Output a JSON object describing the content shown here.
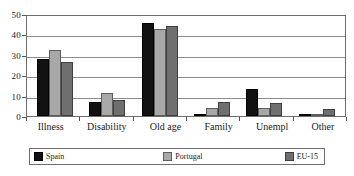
{
  "chart_data": {
    "type": "bar",
    "title": "",
    "subtitle": "",
    "xlabel": "",
    "ylabel": "",
    "ylim": [
      0,
      50
    ],
    "yticks": [
      0,
      10,
      20,
      30,
      40,
      50
    ],
    "grid": true,
    "legend_position": "bottom",
    "categories": [
      "Illness",
      "Disability",
      "Old age",
      "Family",
      "Unempl",
      "Other"
    ],
    "series": [
      {
        "name": "Spain",
        "color": "#121212",
        "values": [
          28.0,
          7.0,
          45.5,
          0.5,
          13.0,
          0.5
        ]
      },
      {
        "name": "Portugal",
        "color": "#a8a8a8",
        "values": [
          32.5,
          11.5,
          42.5,
          4.0,
          4.0,
          0.5
        ]
      },
      {
        "name": "EU-15",
        "color": "#6f6f6f",
        "values": [
          26.5,
          8.0,
          44.0,
          7.0,
          6.5,
          3.5
        ]
      }
    ]
  },
  "legend": {
    "items": [
      {
        "label": "Spain"
      },
      {
        "label": "Portugal"
      },
      {
        "label": "EU-15"
      }
    ]
  }
}
